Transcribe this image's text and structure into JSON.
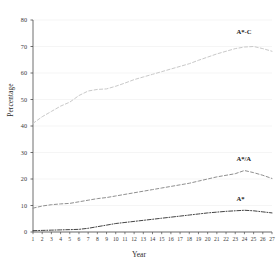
{
  "chart_data": {
    "type": "line",
    "title": "",
    "xlabel": "Year",
    "ylabel": "Percentage",
    "xlim": [
      1,
      27
    ],
    "ylim": [
      0,
      80
    ],
    "yticks": [
      0,
      10,
      20,
      30,
      40,
      50,
      60,
      70,
      80
    ],
    "xticks": [
      1,
      2,
      3,
      4,
      5,
      6,
      7,
      8,
      9,
      10,
      11,
      12,
      13,
      14,
      15,
      16,
      17,
      18,
      19,
      20,
      21,
      22,
      23,
      24,
      25,
      26,
      27
    ],
    "grid": true,
    "grid_axis": "y",
    "legend": "inline-labels",
    "x": [
      1,
      2,
      3,
      4,
      5,
      6,
      7,
      8,
      9,
      10,
      11,
      12,
      13,
      14,
      15,
      16,
      17,
      18,
      19,
      20,
      21,
      22,
      23,
      24,
      25,
      26,
      27
    ],
    "series": [
      {
        "name": "A*-C",
        "label": "A*-C",
        "style": "dashed",
        "color": "#c9c9c9",
        "label_x": 24,
        "label_y": 75,
        "values": [
          41.0,
          43.5,
          45.5,
          47.5,
          49.0,
          51.5,
          53.2,
          53.8,
          54.0,
          55.0,
          56.2,
          57.5,
          58.5,
          59.5,
          60.5,
          61.5,
          62.5,
          63.5,
          64.8,
          66.0,
          67.2,
          68.2,
          69.2,
          69.8,
          70.0,
          69.2,
          68.2
        ]
      },
      {
        "name": "A*/A",
        "label": "A*/A",
        "style": "dashed",
        "color": "#8f8f8f",
        "label_x": 24,
        "label_y": 27,
        "values": [
          9.0,
          9.8,
          10.3,
          10.6,
          10.8,
          11.4,
          12.0,
          12.6,
          13.0,
          13.6,
          14.2,
          14.8,
          15.4,
          16.0,
          16.6,
          17.2,
          17.8,
          18.4,
          19.2,
          20.0,
          20.8,
          21.4,
          22.0,
          23.2,
          22.4,
          21.4,
          20.2
        ]
      },
      {
        "name": "A*",
        "label": "A*",
        "style": "dashdot",
        "color": "#2e2e2e",
        "label_x": 24,
        "label_y": 12,
        "values": [
          0.5,
          0.6,
          0.7,
          0.8,
          0.9,
          1.0,
          1.4,
          2.0,
          2.6,
          3.2,
          3.6,
          4.0,
          4.4,
          4.8,
          5.2,
          5.6,
          6.0,
          6.4,
          6.8,
          7.2,
          7.5,
          7.8,
          8.0,
          8.2,
          8.0,
          7.6,
          7.2
        ]
      }
    ],
    "axis_color": "#4a4a4a",
    "grid_color": "#f0f0f0",
    "plot_box": {
      "left": 33,
      "right": 272,
      "top": 20,
      "bottom": 232
    }
  }
}
